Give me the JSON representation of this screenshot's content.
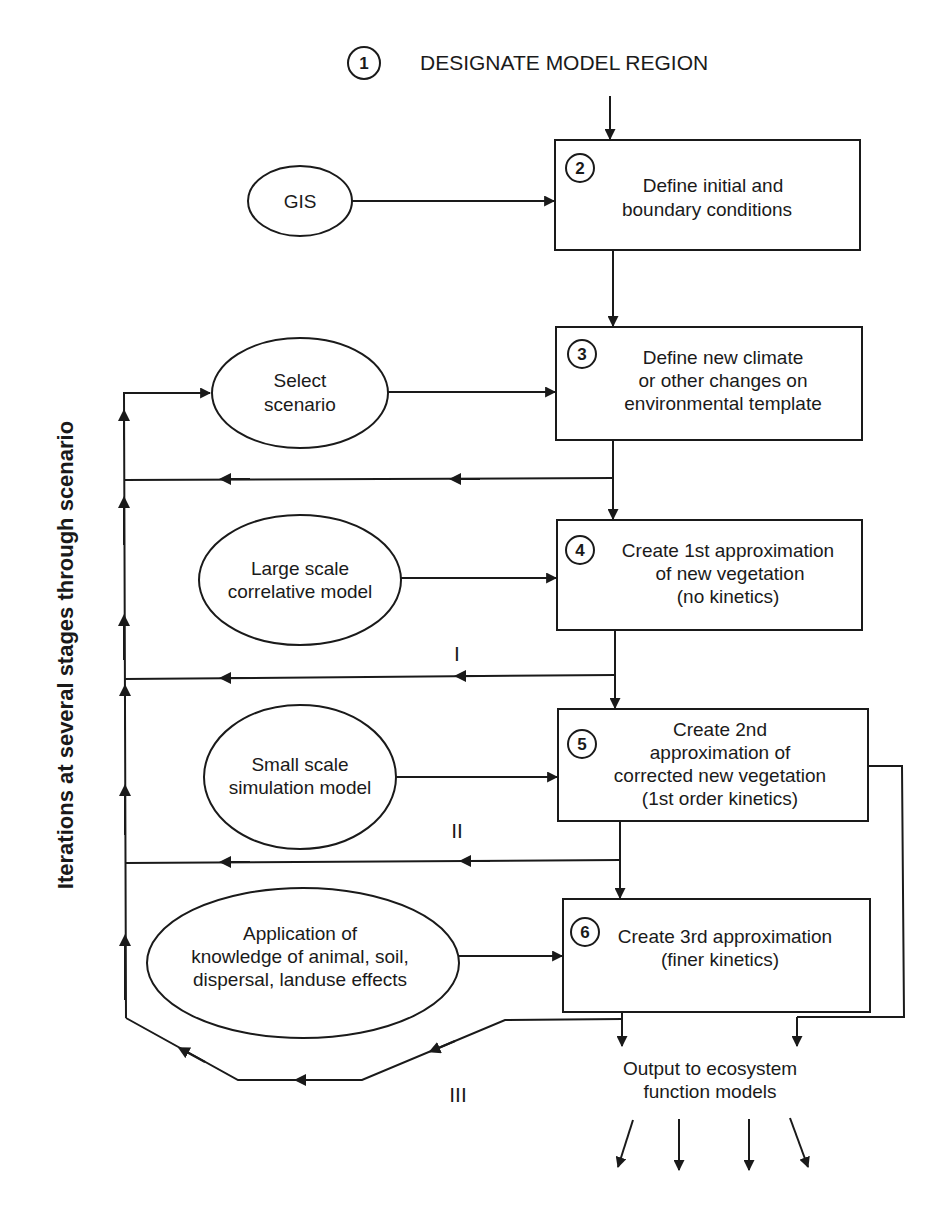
{
  "diagram": {
    "title": {
      "number": "1",
      "label": "DESIGNATE MODEL REGION"
    },
    "steps": [
      {
        "number": "2",
        "lines": [
          "Define initial and",
          "boundary conditions"
        ]
      },
      {
        "number": "3",
        "lines": [
          "Define new climate",
          "or other changes on",
          "environmental template"
        ]
      },
      {
        "number": "4",
        "lines": [
          "Create 1st approximation",
          "of new vegetation",
          "(no kinetics)"
        ]
      },
      {
        "number": "5",
        "lines": [
          "Create 2nd",
          "approximation of",
          "corrected new vegetation",
          "(1st order kinetics)"
        ]
      },
      {
        "number": "6",
        "lines": [
          "Create 3rd approximation",
          "(finer kinetics)"
        ]
      }
    ],
    "inputs": [
      {
        "lines": [
          "GIS"
        ]
      },
      {
        "lines": [
          "Select",
          "scenario"
        ]
      },
      {
        "lines": [
          "Large scale",
          "correlative model"
        ]
      },
      {
        "lines": [
          "Small scale",
          "simulation model"
        ]
      },
      {
        "lines": [
          "Application of",
          "knowledge of animal, soil,",
          "dispersal, landuse effects"
        ]
      }
    ],
    "loop_labels": [
      "I",
      "II",
      "III"
    ],
    "side_label": "Iterations at several stages through scenario",
    "output": {
      "lines": [
        "Output to ecosystem",
        "function models"
      ]
    },
    "colors": {
      "stroke": "#1a1a1a",
      "background": "#ffffff"
    }
  }
}
